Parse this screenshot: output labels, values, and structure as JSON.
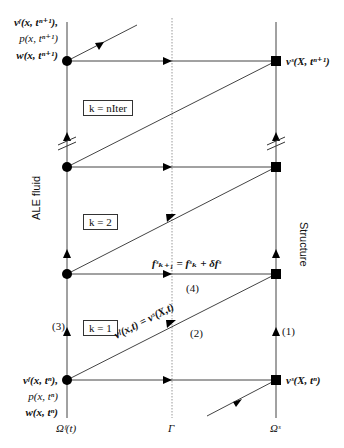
{
  "diagram": {
    "domains": {
      "fluid_axis_label": "ALE fluid",
      "structure_axis_label": "Structure",
      "fluid_domain": "Ωᶠ(t)",
      "interface": "Γ",
      "structure_domain": "Ωˢ"
    },
    "top_left_labels": [
      "vᶠ(x, tⁿ⁺¹),",
      "p(x, tⁿ⁺¹)",
      "w(x, tⁿ⁺¹)"
    ],
    "top_right_label": "vˢ(X, tⁿ⁺¹)",
    "bottom_left_labels": [
      "vᶠ(x, tⁿ),",
      "p(x, tⁿ)",
      "w(x, tⁿ)"
    ],
    "bottom_right_label": "vˢ(X, tⁿ)",
    "iterations": [
      {
        "label": "k = nIter"
      },
      {
        "label": "k = 2"
      },
      {
        "label": "k = 1"
      }
    ],
    "force_update": "fˢₖ₊₁ = fˢₖ + δfˢ",
    "velocity_coupling": "vᶠ(x,t) = vˢ(X,t)",
    "steps": [
      "(1)",
      "(2)",
      "(3)",
      "(4)"
    ],
    "colors": {
      "line": "#333333",
      "node": "#000000",
      "interface": "#999999"
    }
  }
}
